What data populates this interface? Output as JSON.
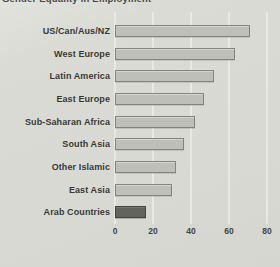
{
  "figure": {
    "title_partial": "Gender Equality in Employment",
    "background_color": "#d8d9d3",
    "bar_fill_color": "#bec0b8",
    "bar_border_color": "#83857d",
    "highlight_bar_fill_color": "#62645c",
    "gridline_color": "#e9eae4",
    "text_color": "#393934"
  },
  "chart_data": {
    "type": "bar",
    "orientation": "horizontal",
    "title": "Gender Equality in Employment",
    "categories": [
      "US/Can/Aus/NZ",
      "West Europe",
      "Latin America",
      "East Europe",
      "Sub-Saharan Africa",
      "South Asia",
      "Other Islamic",
      "East Asia",
      "Arab Countries"
    ],
    "values": [
      70,
      62,
      51,
      46,
      41,
      35,
      31,
      29,
      15
    ],
    "highlight_category": "Arab Countries",
    "xlabel": "",
    "ylabel": "",
    "xlim": [
      0,
      80
    ],
    "xticks": [
      0,
      20,
      40,
      60,
      80
    ],
    "grid": true,
    "legend": false
  }
}
